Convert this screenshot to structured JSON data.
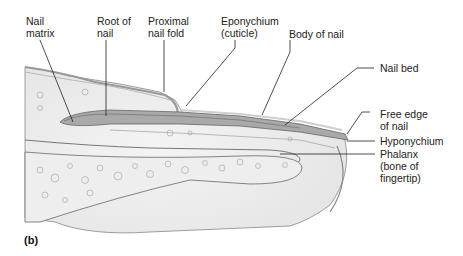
{
  "figure": {
    "panel_label": "(b)",
    "labels": {
      "nail_matrix": "Nail\nmatrix",
      "root_of_nail": "Root of\nnail",
      "proximal_nail_fold": "Proximal\nnail fold",
      "eponychium": "Eponychium\n(cuticle)",
      "body_of_nail": "Body of nail",
      "nail_bed": "Nail bed",
      "free_edge": "Free edge\nof nail",
      "hyponychium": "Hyponychium",
      "phalanx": "Phalanx\n(bone of\nfingertip)"
    }
  }
}
